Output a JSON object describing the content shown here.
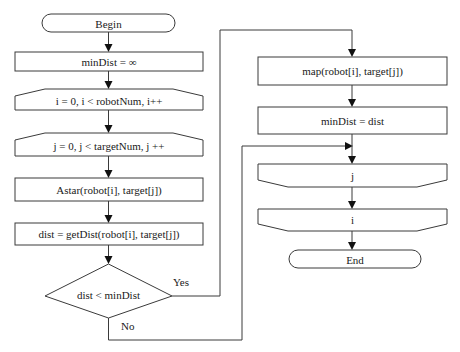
{
  "diagram": {
    "type": "flowchart",
    "nodes": {
      "begin": {
        "label": "Begin",
        "shape": "terminator"
      },
      "init_min": {
        "label": "minDist = ∞",
        "shape": "process"
      },
      "loop_i_start": {
        "label": "i = 0, i < robotNum, i++",
        "shape": "loop-start"
      },
      "loop_j_start": {
        "label": "j = 0, j < targetNum, j ++",
        "shape": "loop-start"
      },
      "astar": {
        "label": "Astar(robot[i], target[j])",
        "shape": "process"
      },
      "get_dist": {
        "label": "dist = getDist(robot[i], target[j])",
        "shape": "process"
      },
      "decision": {
        "label": "dist < minDist",
        "shape": "decision"
      },
      "map": {
        "label": "map(robot[i], target[j])",
        "shape": "process"
      },
      "update_min": {
        "label": "minDist = dist",
        "shape": "process"
      },
      "loop_j_end": {
        "label": "j",
        "shape": "loop-end"
      },
      "loop_i_end": {
        "label": "i",
        "shape": "loop-end"
      },
      "end": {
        "label": "End",
        "shape": "terminator"
      }
    },
    "edges": {
      "yes": {
        "label": "Yes",
        "from": "decision",
        "to": "map"
      },
      "no": {
        "label": "No",
        "from": "decision",
        "to": "loop_j_end"
      }
    }
  }
}
